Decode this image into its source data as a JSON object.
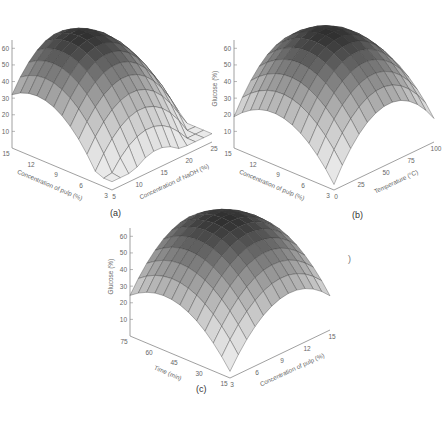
{
  "figure": {
    "panels": [
      {
        "id": "a",
        "label": "(a)"
      },
      {
        "id": "b",
        "label": "(b)"
      },
      {
        "id": "c",
        "label": "(c)"
      }
    ],
    "stray_mark": ")"
  },
  "chart_data": [
    {
      "type": "surface3d",
      "panel": "(a)",
      "zlabel": "Glucose (%)",
      "xlabel": "Concentration of NaOH (%)",
      "ylabel": "Concentration of pulp (%)",
      "z_ticks": [
        10,
        20,
        30,
        40,
        50,
        60
      ],
      "x_ticks": [
        5,
        10,
        15,
        20,
        25
      ],
      "y_ticks": [
        3,
        6,
        9,
        12,
        15
      ],
      "zlim": [
        0,
        65
      ],
      "grid": [
        12,
        12
      ],
      "surface": {
        "peak": 62,
        "x_opt": 0.45,
        "y_opt": 0.75,
        "curv_x": 1.6,
        "curv_y": 1.2,
        "min_corner": 5
      },
      "legend": null
    },
    {
      "type": "surface3d",
      "panel": "(b)",
      "zlabel": "Glucose (%)",
      "xlabel": "Temperature (°C)",
      "ylabel": "Concentration of pulp (%)",
      "z_ticks": [
        10,
        20,
        30,
        40,
        50,
        60
      ],
      "x_ticks": [
        0,
        25,
        50,
        75,
        100
      ],
      "y_ticks": [
        3,
        6,
        9,
        12,
        15
      ],
      "zlim": [
        0,
        65
      ],
      "grid": [
        12,
        12
      ],
      "surface": {
        "peak": 64,
        "x_opt": 0.55,
        "y_opt": 0.6,
        "curv_x": 1.4,
        "curv_y": 1.0,
        "min_corner": 3
      },
      "legend": null
    },
    {
      "type": "surface3d",
      "panel": "(c)",
      "zlabel": "Glucose (%)",
      "xlabel": "Concentration of pulp (%)",
      "ylabel": "Time (min)",
      "z_ticks": [
        10,
        20,
        30,
        40,
        50,
        60
      ],
      "x_ticks": [
        3,
        6,
        9,
        12,
        15
      ],
      "y_ticks": [
        15,
        30,
        45,
        60,
        75
      ],
      "zlim": [
        0,
        65
      ],
      "grid": [
        12,
        12
      ],
      "surface": {
        "peak": 63,
        "x_opt": 0.6,
        "y_opt": 0.65,
        "curv_x": 1.1,
        "curv_y": 0.9,
        "min_corner": 4
      },
      "legend": null
    }
  ]
}
